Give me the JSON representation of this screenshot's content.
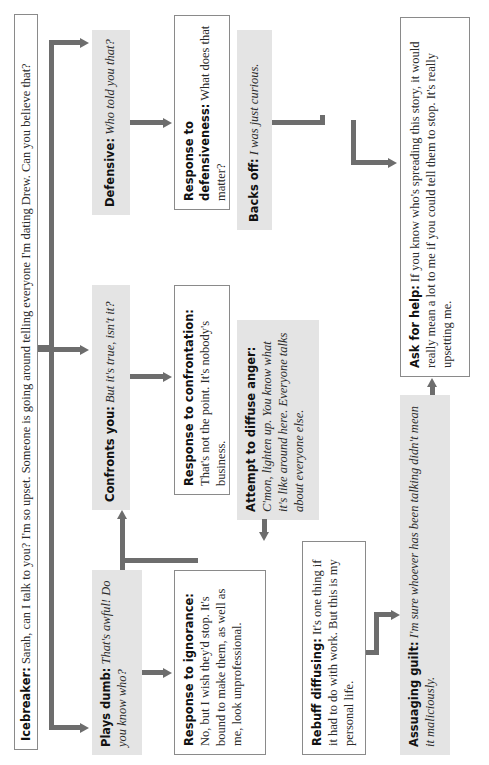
{
  "diagram": {
    "orientation": "rotated 90 degrees counter-clockwise",
    "colors": {
      "arrow": "#6d6d6d",
      "gray_box": "#e4e4e4",
      "white_box_border": "#8a8a8a"
    },
    "icebreaker": {
      "label": "Icebreaker:",
      "text": " Sarah, can I talk to you? I'm so upset. Someone is going around telling everyone I'm dating Drew. Can you believe that?"
    },
    "reactions": [
      {
        "id": "plays_dumb",
        "label": "Plays dumb:",
        "text": " That's awful! Do you know who?"
      },
      {
        "id": "confronts",
        "label": "Confronts you:",
        "text": " But it's true, isn't it?"
      },
      {
        "id": "defensive",
        "label": "Defensive:",
        "text": " Who told you that?"
      }
    ],
    "responses": [
      {
        "id": "ignorance",
        "label": "Response to ignorance:",
        "text": " No, but I wish they'd stop. It's bound to make them, as well as me, look unprofessional."
      },
      {
        "id": "confrontation",
        "label": "Response to confrontation:",
        "text": " That's not the point. It's nobody's business."
      },
      {
        "id": "defensiveness",
        "label": "Response to defensiveness:",
        "text": " What does that matter?"
      }
    ],
    "second_round": [
      {
        "id": "rebuff",
        "label": "Rebuff diffusing:",
        "text": " It's one thing if it had to do with work. But this is my personal life."
      },
      {
        "id": "diffuse_anger",
        "label": "Attempt to diffuse anger:",
        "text": " C'mon, lighten up. You know what it's like around here. Everyone talks about everyone else."
      },
      {
        "id": "backs_off",
        "label": "Backs off:",
        "text": " I was just curious."
      }
    ],
    "final_round": [
      {
        "id": "assuaging",
        "label": "Assuaging guilt:",
        "text": " I'm sure whoever has been talking didn't mean it maliciously."
      },
      {
        "id": "ask_help",
        "label": "Ask for help:",
        "text": " If you know who's spreading this story, it would really mean a lot to me if you could tell them to stop. It's really upsetting me."
      }
    ]
  }
}
